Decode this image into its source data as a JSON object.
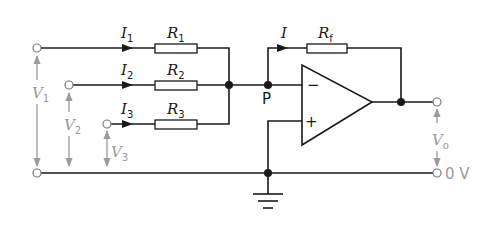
{
  "diagram": {
    "type": "summing amplifier circuit",
    "inputs": [
      {
        "current": "I",
        "current_sub": "1",
        "resistor": "R",
        "resistor_sub": "1",
        "voltage": "V",
        "voltage_sub": "1"
      },
      {
        "current": "I",
        "current_sub": "2",
        "resistor": "R",
        "resistor_sub": "2",
        "voltage": "V",
        "voltage_sub": "2"
      },
      {
        "current": "I",
        "current_sub": "3",
        "resistor": "R",
        "resistor_sub": "3",
        "voltage": "V",
        "voltage_sub": "3"
      }
    ],
    "feedback": {
      "current": "I",
      "resistor": "R",
      "resistor_sub": "f"
    },
    "node_label": "P",
    "opamp": {
      "inverting": "−",
      "non_inverting": "+"
    },
    "output": {
      "voltage": "V",
      "voltage_sub": "o"
    },
    "ground_label": "0 V",
    "colors": {
      "wire": "#1a1a1a",
      "voltage_arrow": "#9a9a9a",
      "background": "#ffffff"
    }
  }
}
